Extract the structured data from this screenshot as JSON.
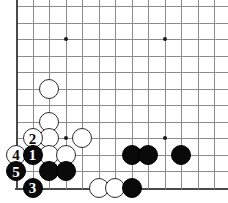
{
  "board": {
    "title": "Go board diagram",
    "corner": "bottom-left",
    "visible_columns": 13,
    "visible_rows": 12,
    "grid_spacing_px": 16.5,
    "origin_x_px": 16,
    "origin_y_px": 6,
    "line_color": "#8c8c8c",
    "edge_color": "#4a4a4a",
    "background_color": "#ffffff",
    "black_color": "#0a0a0a",
    "white_color": "#ffffff",
    "stone_diameter_px": 20,
    "star_points": [
      {
        "name": "star-point-upper-left",
        "col": 4,
        "row": 3
      },
      {
        "name": "star-point-upper-right",
        "col": 10,
        "row": 3
      },
      {
        "name": "star-point-lower-left",
        "col": 4,
        "row": 9
      },
      {
        "name": "star-point-lower-right",
        "col": 10,
        "row": 9
      }
    ],
    "stones": [
      {
        "name": "white-stone-c6",
        "color": "white",
        "col": 3,
        "row": 6,
        "label": ""
      },
      {
        "name": "white-stone-c8",
        "color": "white",
        "col": 3,
        "row": 8,
        "label": ""
      },
      {
        "name": "white-stone-c9",
        "color": "white",
        "col": 3,
        "row": 9,
        "label": ""
      },
      {
        "name": "white-stone-c10",
        "color": "white",
        "col": 3,
        "row": 10,
        "label": ""
      },
      {
        "name": "white-stone-d10",
        "color": "white",
        "col": 4,
        "row": 10,
        "label": ""
      },
      {
        "name": "white-stone-e9",
        "color": "white",
        "col": 5,
        "row": 9,
        "label": ""
      },
      {
        "name": "white-move-2",
        "color": "white",
        "col": 2,
        "row": 9,
        "label": "2"
      },
      {
        "name": "white-move-4",
        "color": "white",
        "col": 1,
        "row": 10,
        "label": "4"
      },
      {
        "name": "black-move-1",
        "color": "black",
        "col": 2,
        "row": 10,
        "label": "1"
      },
      {
        "name": "black-move-5",
        "color": "black",
        "col": 1,
        "row": 11,
        "label": "5"
      },
      {
        "name": "black-move-3",
        "color": "black",
        "col": 2,
        "row": 12,
        "label": "3"
      },
      {
        "name": "black-stone-c11",
        "color": "black",
        "col": 3,
        "row": 11,
        "label": ""
      },
      {
        "name": "black-stone-d11",
        "color": "black",
        "col": 4,
        "row": 11,
        "label": ""
      },
      {
        "name": "white-stone-f12",
        "color": "white",
        "col": 6,
        "row": 12,
        "label": ""
      },
      {
        "name": "white-stone-g12",
        "color": "white",
        "col": 7,
        "row": 12,
        "label": ""
      },
      {
        "name": "black-stone-h12",
        "color": "black",
        "col": 8,
        "row": 12,
        "label": ""
      },
      {
        "name": "black-stone-h10",
        "color": "black",
        "col": 8,
        "row": 10,
        "label": ""
      },
      {
        "name": "black-stone-i10",
        "color": "black",
        "col": 9,
        "row": 10,
        "label": ""
      },
      {
        "name": "black-stone-k10",
        "color": "black",
        "col": 11,
        "row": 10,
        "label": ""
      }
    ]
  }
}
